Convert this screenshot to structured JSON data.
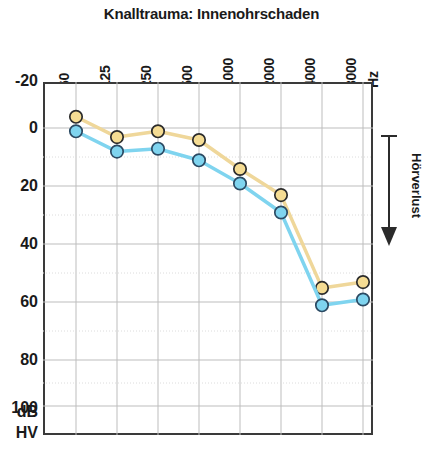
{
  "chart_data": {
    "type": "line",
    "title": "Knalltrauma: Innenohrschaden",
    "xlabel": "",
    "ylabel": "",
    "x_unit": "Hz",
    "y_unit_line1": "dB",
    "y_unit_line2": "HV",
    "categories": [
      "60",
      "125",
      "250",
      "500",
      "1000",
      "2000",
      "4000",
      "8000"
    ],
    "xticklabels": [
      "60",
      "125",
      "250",
      "500",
      "1000",
      "2000",
      "4000",
      "8000"
    ],
    "yticklabels": [
      "-20",
      "0",
      "20",
      "40",
      "60",
      "80",
      "100"
    ],
    "yticks": [
      -20,
      0,
      20,
      40,
      60,
      80,
      100
    ],
    "ylim": [
      -20,
      110
    ],
    "y_inverted": true,
    "grid": true,
    "legend": "none",
    "series": [
      {
        "name": "rechtes Ohr",
        "color": "#EFD79A",
        "marker_fill": "#F5DC93",
        "marker_edge": "#2b2b2b",
        "values": [
          -8,
          -1,
          -3,
          0,
          10,
          19,
          51,
          49
        ]
      },
      {
        "name": "linkes Ohr",
        "color": "#7FD4EF",
        "marker_fill": "#7FD4EF",
        "marker_edge": "#2b4a63",
        "values": [
          -3,
          4,
          3,
          7,
          15,
          25,
          57,
          55
        ]
      }
    ],
    "annotations": [
      {
        "text": "Hörverlust",
        "direction": "down",
        "position": "right-outside"
      }
    ]
  },
  "colors": {
    "axis": "#3a3a3a",
    "grid": "#b8b8b8",
    "background": "#ffffff",
    "text": "#1a1a1a",
    "series_yellow": "#EFD79A",
    "series_cyan": "#7FD4EF"
  }
}
